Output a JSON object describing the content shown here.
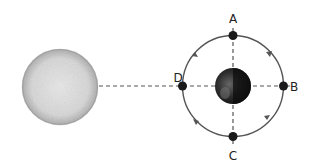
{
  "diagram": {
    "title": "",
    "sun": {
      "name": "Sun",
      "label": ""
    },
    "earth": {
      "name": "Earth",
      "label": ""
    },
    "moon_positions": [
      {
        "id": "A",
        "label": "A",
        "position": "top"
      },
      {
        "id": "B",
        "label": "B",
        "position": "right"
      },
      {
        "id": "C",
        "label": "C",
        "position": "bottom"
      },
      {
        "id": "D",
        "label": "D",
        "position": "left"
      }
    ],
    "orbit_direction": "counterclockwise",
    "colors": {
      "orbit": "#555555",
      "dashed_line": "#555555",
      "sun_fill": "#d4d4d4",
      "moon_fill": "#1a1a1a",
      "earth_fill": "#2a2a2a",
      "label": "#222222"
    }
  }
}
